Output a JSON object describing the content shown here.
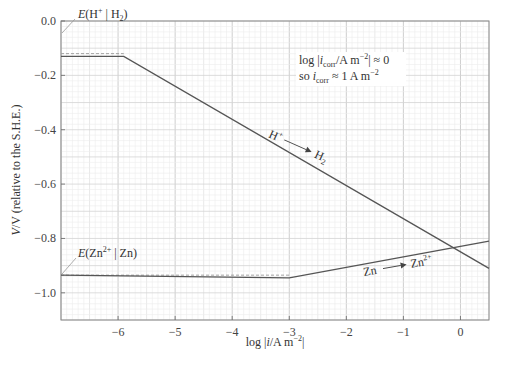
{
  "chart_data": {
    "type": "line",
    "title": "",
    "xlabel": "log |i/A m⁻²|",
    "ylabel": "V/V (relative to the S.H.E.)",
    "xlim": [
      -7,
      0.5
    ],
    "ylim": [
      -1.1,
      0.0
    ],
    "grid": true,
    "x_ticks": [
      "−6",
      "−5",
      "−4",
      "−3",
      "−2",
      "−1",
      "0"
    ],
    "y_ticks": [
      "0.0",
      "−0.2",
      "−0.4",
      "−0.6",
      "−0.8",
      "−1.0"
    ],
    "series": [
      {
        "name": "H⁺ → H₂",
        "x": [
          -7,
          -5.9,
          0.5
        ],
        "y": [
          -0.13,
          -0.13,
          -0.91
        ]
      },
      {
        "name": "Zn → Zn²⁺",
        "x": [
          -7,
          -3,
          0.5
        ],
        "y": [
          -0.935,
          -0.945,
          -0.81
        ]
      }
    ],
    "reference_lines": [
      {
        "name": "E(H⁺ | H₂)",
        "y": -0.12,
        "x_range": [
          -7,
          -5.9
        ],
        "style": "dashed"
      },
      {
        "name": "E(Zn²⁺ | Zn)",
        "y": -0.935,
        "x_range": [
          -7,
          -3
        ],
        "style": "dashed"
      }
    ],
    "annotations": [
      "E(H⁺ | H₂)",
      "E(Zn²⁺ | Zn)",
      "log |i_corr/A m⁻²| ≈ 0",
      "so i_corr ≈ 1 A m⁻²",
      "H⁺ → H₂",
      "Zn → Zn²⁺"
    ]
  },
  "labels": {
    "x_axis": "log |i/A m",
    "x_axis_sup": "−2",
    "y_axis": "V/V (relative to the S.H.E.)",
    "h_ref": "E(H",
    "zn_ref": "E(Zn",
    "note_line1": "log |i",
    "note_line1_sub": "corr",
    "note_line1_rest": "/A m",
    "note_line1_tail": "| ≈ 0",
    "note_line2": "so i",
    "note_line2_rest": "≈ 1 A m",
    "h_react": "H",
    "h_prod": "H",
    "zn_react": "Zn",
    "zn_prod": "Zn"
  }
}
